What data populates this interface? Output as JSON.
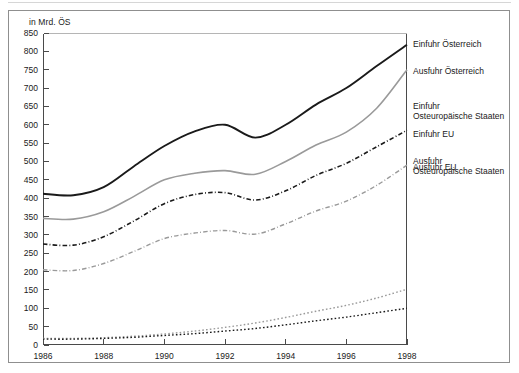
{
  "figure": {
    "unit_label": "in Mrd. ÖS"
  },
  "chart_data": {
    "type": "line",
    "title": "",
    "subtitle": "",
    "xlabel": "",
    "ylabel": "in Mrd. ÖS",
    "unit": "Mrd. ÖS",
    "grid": false,
    "legend_position": "right-inline-annotations",
    "xlim": [
      1986,
      1998
    ],
    "ylim": [
      0,
      850
    ],
    "ytick_step": 50,
    "x": [
      1986,
      1987,
      1988,
      1989,
      1990,
      1991,
      1992,
      1993,
      1994,
      1995,
      1996,
      1997,
      1998
    ],
    "xtick_labels": [
      "1986",
      "1988",
      "1990",
      "1992",
      "1994",
      "1996",
      "1998"
    ],
    "xticks": [
      1986,
      1988,
      1990,
      1992,
      1994,
      1996,
      1998
    ],
    "ytick_labels": [
      "0",
      "50",
      "100",
      "150",
      "200",
      "250",
      "300",
      "350",
      "400",
      "450",
      "500",
      "550",
      "600",
      "650",
      "700",
      "750",
      "800",
      "850"
    ],
    "series": [
      {
        "name": "Einfuhr Österreich",
        "label_lines": [
          "Einfuhr Österreich"
        ],
        "color": "#1a1a1a",
        "style": "solid",
        "width": 1.9,
        "label_y": 40,
        "values": [
          412,
          408,
          430,
          487,
          542,
          582,
          600,
          565,
          600,
          655,
          700,
          760,
          818
        ]
      },
      {
        "name": "Ausfuhr Österreich",
        "label_lines": [
          "Ausfuhr Österreich"
        ],
        "color": "#9a9a9a",
        "style": "solid",
        "width": 1.6,
        "label_y": 67,
        "values": [
          345,
          343,
          363,
          405,
          450,
          468,
          475,
          465,
          500,
          545,
          580,
          645,
          750
        ]
      },
      {
        "name": "Einfuhr EU",
        "label_lines": [
          "Einfuhr EU"
        ],
        "color": "#1a1a1a",
        "style": "dashdot",
        "width": 1.6,
        "label_y": 130,
        "values": [
          275,
          272,
          295,
          338,
          385,
          410,
          415,
          395,
          420,
          462,
          495,
          540,
          585
        ]
      },
      {
        "name": "Ausfuhr EU",
        "label_lines": [
          "Ausfuhr EU"
        ],
        "color": "#9a9a9a",
        "style": "dashdot",
        "width": 1.4,
        "label_y": 163,
        "values": [
          205,
          203,
          222,
          255,
          290,
          305,
          312,
          302,
          330,
          365,
          392,
          435,
          490
        ]
      },
      {
        "name": "Ausfuhr Osteuropäische Staaten",
        "label_lines": [
          "Ausfuhr",
          "Osteuropäische Staaten"
        ],
        "color": "#9a9a9a",
        "style": "dotted",
        "width": 1.4,
        "label_y": 157,
        "values": [
          18,
          18,
          20,
          24,
          30,
          38,
          48,
          60,
          75,
          92,
          108,
          128,
          152
        ]
      },
      {
        "name": "Einfuhr Osteuropäische Staaten",
        "label_lines": [
          "Einfuhr",
          "Osteuropäische Staaten"
        ],
        "color": "#1a1a1a",
        "style": "dotted",
        "width": 1.4,
        "label_y": 102,
        "values": [
          16,
          16,
          18,
          21,
          26,
          31,
          38,
          45,
          55,
          66,
          76,
          88,
          100
        ]
      }
    ]
  }
}
